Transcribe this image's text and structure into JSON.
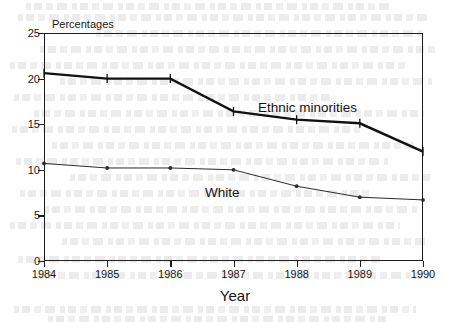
{
  "chart_data": {
    "type": "line",
    "title": "",
    "xlabel": "Year",
    "ylabel": "Percentages",
    "categories": [
      "1984",
      "1985",
      "1986",
      "1987",
      "1988",
      "1989",
      "1990"
    ],
    "xlim": [
      1984,
      1990
    ],
    "ylim": [
      0,
      25
    ],
    "ytick_labels": [
      "0",
      "5",
      "10",
      "15",
      "20",
      "25"
    ],
    "ytick_values": [
      0,
      5,
      10,
      15,
      20,
      25
    ],
    "grid": false,
    "legend_position": "inline-annotations",
    "series": [
      {
        "name": "Ethnic minorities",
        "values": [
          20.6,
          20.0,
          20.0,
          16.4,
          15.5,
          15.1,
          12.0
        ],
        "color": "#111111",
        "line_width": 2.4,
        "marker": "vertical-tick",
        "label_x": 1988.0,
        "label_y": 17.6
      },
      {
        "name": "White",
        "values": [
          10.7,
          10.2,
          10.2,
          10.0,
          8.2,
          7.0,
          6.7
        ],
        "color": "#2a2a2a",
        "line_width": 1.0,
        "marker": "dot",
        "label_x": 1986.9,
        "label_y": 8.9
      }
    ],
    "annotations": [
      {
        "text": "Ethnic minorities",
        "x": 1988.0,
        "y": 17.6
      },
      {
        "text": "White",
        "x": 1986.9,
        "y": 8.9
      }
    ]
  },
  "axes": {
    "y_axis_title": "Percentages",
    "x_axis_title": "Year"
  }
}
